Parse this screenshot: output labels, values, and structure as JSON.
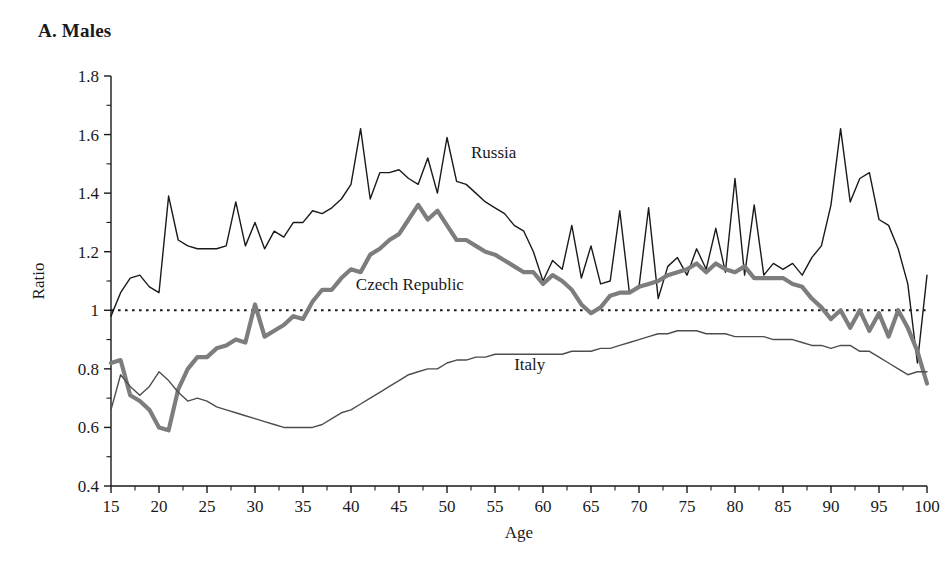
{
  "panel": {
    "title": "A. Males"
  },
  "chart_data": {
    "type": "line",
    "title": "A. Males",
    "xlabel": "Age",
    "ylabel": "Ratio",
    "xlim": [
      15,
      100
    ],
    "ylim": [
      0.4,
      1.8
    ],
    "xticks": [
      15,
      20,
      25,
      30,
      35,
      40,
      45,
      50,
      55,
      60,
      65,
      70,
      75,
      80,
      85,
      90,
      95,
      100
    ],
    "xtick_labels": [
      "15",
      "20",
      "25",
      "30",
      "35",
      "40",
      "45",
      "50",
      "55",
      "60",
      "65",
      "70",
      "75",
      "80",
      "85",
      "90",
      "95",
      "100"
    ],
    "xtick_minor_step": 1,
    "yticks": [
      0.4,
      0.6,
      0.8,
      1.0,
      1.2,
      1.4,
      1.6,
      1.8
    ],
    "ytick_labels": [
      "0.4",
      "0.6",
      "0.8",
      "1",
      "1.2",
      "1.4",
      "1.6",
      "1.8"
    ],
    "ytick_minor_step": 0.1,
    "grid": false,
    "legend_position": "inline-annotations",
    "reference_line": {
      "y": 1.0,
      "style": "dotted",
      "color": "#1a1a1a"
    },
    "annotations": [
      {
        "label": "Russia",
        "x": 52.5,
        "y": 1.52
      },
      {
        "label": "Czech Republic",
        "x": 40.5,
        "y": 1.07
      },
      {
        "label": "Italy",
        "x": 57.0,
        "y": 0.795
      }
    ],
    "x": [
      15,
      16,
      17,
      18,
      19,
      20,
      21,
      22,
      23,
      24,
      25,
      26,
      27,
      28,
      29,
      30,
      31,
      32,
      33,
      34,
      35,
      36,
      37,
      38,
      39,
      40,
      41,
      42,
      43,
      44,
      45,
      46,
      47,
      48,
      49,
      50,
      51,
      52,
      53,
      54,
      55,
      56,
      57,
      58,
      59,
      60,
      61,
      62,
      63,
      64,
      65,
      66,
      67,
      68,
      69,
      70,
      71,
      72,
      73,
      74,
      75,
      76,
      77,
      78,
      79,
      80,
      81,
      82,
      83,
      84,
      85,
      86,
      87,
      88,
      89,
      90,
      91,
      92,
      93,
      94,
      95,
      96,
      97,
      98,
      99,
      100
    ],
    "series": [
      {
        "name": "Russia",
        "color": "#1a1a1a",
        "style": "thin-solid",
        "values": [
          0.98,
          1.06,
          1.11,
          1.12,
          1.08,
          1.06,
          1.39,
          1.24,
          1.22,
          1.21,
          1.21,
          1.21,
          1.22,
          1.37,
          1.22,
          1.3,
          1.21,
          1.27,
          1.25,
          1.3,
          1.3,
          1.34,
          1.33,
          1.35,
          1.38,
          1.43,
          1.62,
          1.38,
          1.47,
          1.47,
          1.48,
          1.45,
          1.43,
          1.52,
          1.4,
          1.59,
          1.44,
          1.43,
          1.4,
          1.37,
          1.35,
          1.33,
          1.29,
          1.27,
          1.2,
          1.1,
          1.17,
          1.14,
          1.29,
          1.11,
          1.22,
          1.09,
          1.1,
          1.34,
          1.06,
          1.08,
          1.35,
          1.04,
          1.15,
          1.18,
          1.12,
          1.21,
          1.14,
          1.28,
          1.13,
          1.45,
          1.12,
          1.36,
          1.12,
          1.16,
          1.14,
          1.16,
          1.12,
          1.18,
          1.22,
          1.36,
          1.62,
          1.37,
          1.45,
          1.47,
          1.31,
          1.29,
          1.21,
          1.09,
          0.82,
          1.12
        ]
      },
      {
        "name": "Czech Republic",
        "color": "#7d7d7d",
        "style": "thick-solid",
        "values": [
          0.82,
          0.83,
          0.71,
          0.69,
          0.66,
          0.6,
          0.59,
          0.73,
          0.8,
          0.84,
          0.84,
          0.87,
          0.88,
          0.9,
          0.89,
          1.02,
          0.91,
          0.93,
          0.95,
          0.98,
          0.97,
          1.03,
          1.07,
          1.07,
          1.11,
          1.14,
          1.13,
          1.19,
          1.21,
          1.24,
          1.26,
          1.31,
          1.36,
          1.31,
          1.34,
          1.29,
          1.24,
          1.24,
          1.22,
          1.2,
          1.19,
          1.17,
          1.15,
          1.13,
          1.13,
          1.09,
          1.12,
          1.1,
          1.07,
          1.02,
          0.99,
          1.01,
          1.05,
          1.06,
          1.06,
          1.08,
          1.09,
          1.1,
          1.12,
          1.13,
          1.14,
          1.16,
          1.13,
          1.16,
          1.14,
          1.13,
          1.15,
          1.11,
          1.11,
          1.11,
          1.11,
          1.09,
          1.08,
          1.04,
          1.01,
          0.97,
          1.0,
          0.94,
          1.0,
          0.93,
          0.99,
          0.91,
          1.0,
          0.94,
          0.86,
          0.75
        ]
      },
      {
        "name": "Italy",
        "color": "#4d4d4d",
        "style": "thin-solid",
        "values": [
          0.66,
          0.78,
          0.74,
          0.71,
          0.74,
          0.79,
          0.76,
          0.72,
          0.69,
          0.7,
          0.69,
          0.67,
          0.66,
          0.65,
          0.64,
          0.63,
          0.62,
          0.61,
          0.6,
          0.6,
          0.6,
          0.6,
          0.61,
          0.63,
          0.65,
          0.66,
          0.68,
          0.7,
          0.72,
          0.74,
          0.76,
          0.78,
          0.79,
          0.8,
          0.8,
          0.82,
          0.83,
          0.83,
          0.84,
          0.84,
          0.85,
          0.85,
          0.85,
          0.85,
          0.85,
          0.85,
          0.85,
          0.85,
          0.86,
          0.86,
          0.86,
          0.87,
          0.87,
          0.88,
          0.89,
          0.9,
          0.91,
          0.92,
          0.92,
          0.93,
          0.93,
          0.93,
          0.92,
          0.92,
          0.92,
          0.91,
          0.91,
          0.91,
          0.91,
          0.9,
          0.9,
          0.9,
          0.89,
          0.88,
          0.88,
          0.87,
          0.88,
          0.88,
          0.86,
          0.86,
          0.84,
          0.82,
          0.8,
          0.78,
          0.79,
          0.79
        ]
      }
    ]
  }
}
